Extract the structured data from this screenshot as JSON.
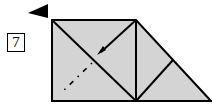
{
  "diagram": {
    "type": "origami-fold-step",
    "step_number": "7",
    "colors": {
      "paper": "#d4d4d4",
      "line": "#000000",
      "background": "#ffffff"
    },
    "shapes": {
      "paper_outline": "52,20 136,20 211,101 52,101",
      "fold_lines": [
        {
          "x1": 52,
          "y1": 20,
          "x2": 136,
          "y2": 101
        },
        {
          "x1": 136,
          "y1": 20,
          "x2": 136,
          "y2": 101
        },
        {
          "x1": 136,
          "y1": 101,
          "x2": 173,
          "y2": 60
        },
        {
          "x1": 136,
          "y1": 20,
          "x2": 103,
          "y2": 50
        }
      ],
      "mountain_fold_line": {
        "x1": 100,
        "y1": 54,
        "x2": 60,
        "y2": 94
      },
      "direction_arrow": "28,13 48,4 48,18"
    }
  }
}
